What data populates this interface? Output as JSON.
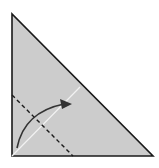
{
  "diagram": {
    "type": "origami-fold-step",
    "paper": {
      "shape": "right-triangle",
      "fill": "#cccccc",
      "edge_color": "#1a1a1a",
      "vertices": [
        [
          12,
          14
        ],
        [
          12,
          156
        ],
        [
          153,
          156
        ]
      ]
    },
    "crease_line": {
      "style": "white-solid",
      "color": "#f2f2f2",
      "from": [
        12,
        156
      ],
      "to": [
        80,
        87
      ]
    },
    "fold_line": {
      "style": "dashed",
      "kind": "valley-fold",
      "color": "#1a1a1a",
      "from": [
        12,
        95
      ],
      "to": [
        73,
        156
      ]
    },
    "arrow": {
      "kind": "fold-direction",
      "color": "#333333",
      "from": [
        17,
        148
      ],
      "control": [
        25,
        110
      ],
      "to": [
        72,
        104
      ]
    }
  }
}
